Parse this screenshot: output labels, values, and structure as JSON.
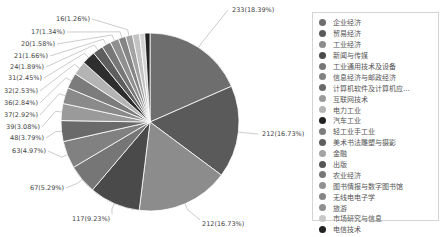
{
  "chart_data": {
    "type": "pie",
    "title": "",
    "total": 1267,
    "categories": [
      "企业经济",
      "贸易经济",
      "工业经济",
      "新闻与传媒",
      "工业通用技术及设备",
      "信息经济与邮政经济",
      "计算机软件及计算机应...",
      "互联网技术",
      "电力工业",
      "汽车工业",
      "轻工业手工业",
      "美术书法雕塑与摄影",
      "金融",
      "出版",
      "农业经济",
      "图书情报与数字图书馆",
      "无线电电子学",
      "旅游",
      "市场研究与信息",
      "电信技术"
    ],
    "values": [
      233,
      212,
      212,
      117,
      67,
      63,
      48,
      39,
      37,
      36,
      32,
      31,
      24,
      21,
      20,
      17,
      16,
      16,
      12,
      12
    ],
    "labels": [
      "233(18.39%)",
      "212(16.73%)",
      "212(16.73%)",
      "117(9.23%)",
      "67(5.29%)",
      "63(4.97%)",
      "48(3.79%)",
      "39(3.08%)",
      "37(2.92%)",
      "36(2.84%)",
      "32(2.53%)",
      "31(2.45%)",
      "24(1.89%)",
      "21(1.66%)",
      "20(1.58%)",
      "17(1.34%)",
      "16(1.26%)",
      "",
      "",
      ""
    ],
    "colors": [
      "#6e6e6e",
      "#5a5a5a",
      "#8c8c8c",
      "#4a4a4a",
      "#767676",
      "#818181",
      "#6a6a6a",
      "#9a9a9a",
      "#8a8a8a",
      "#7c7c7c",
      "#b4b4b4",
      "#2e2e2e",
      "#5e5e5e",
      "#777777",
      "#909090",
      "#858585",
      "#a3a3a3",
      "#c2c2c2",
      "#d4d4d4",
      "#222222"
    ],
    "legend_position": "right"
  },
  "legend": {
    "items": [
      {
        "label": "企业经济",
        "color": "#6e6e6e"
      },
      {
        "label": "贸易经济",
        "color": "#5a5a5a"
      },
      {
        "label": "工业经济",
        "color": "#8c8c8c"
      },
      {
        "label": "新闻与传媒",
        "color": "#4a4a4a"
      },
      {
        "label": "工业通用技术及设备",
        "color": "#767676"
      },
      {
        "label": "信息经济与邮政经济",
        "color": "#818181"
      },
      {
        "label": "计算机软件及计算机应...",
        "color": "#6a6a6a"
      },
      {
        "label": "互联网技术",
        "color": "#9a9a9a"
      },
      {
        "label": "电力工业",
        "color": "#b4b4b4"
      },
      {
        "label": "汽车工业",
        "color": "#222222"
      },
      {
        "label": "轻工业手工业",
        "color": "#7c7c7c"
      },
      {
        "label": "美术书法雕塑与摄影",
        "color": "#5e5e5e"
      },
      {
        "label": "金融",
        "color": "#a3a3a3"
      },
      {
        "label": "出版",
        "color": "#555555"
      },
      {
        "label": "农业经济",
        "color": "#777777"
      },
      {
        "label": "图书情报与数字图书馆",
        "color": "#909090"
      },
      {
        "label": "无线电电子学",
        "color": "#858585"
      },
      {
        "label": "旅游",
        "color": "#8f8f8f"
      },
      {
        "label": "市场研究与信息",
        "color": "#c8c8c8"
      },
      {
        "label": "电信技术",
        "color": "#222222"
      }
    ]
  }
}
